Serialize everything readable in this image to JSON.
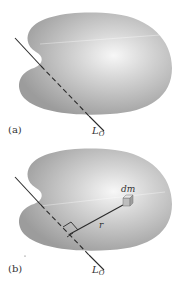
{
  "figure": {
    "panels": [
      {
        "id": "a",
        "label": "(a)",
        "axis_label": "L",
        "axis_subscript": "O"
      },
      {
        "id": "b",
        "label": "(b)",
        "axis_label": "L",
        "axis_subscript": "O",
        "mass_element_label": "dm",
        "radius_label": "r"
      }
    ],
    "colors": {
      "body_fill": "#a9a9a9",
      "body_highlight": "#f4f4f4",
      "axis_line": "#2b2b2b",
      "cube_fill": "#cfcfcf"
    }
  }
}
